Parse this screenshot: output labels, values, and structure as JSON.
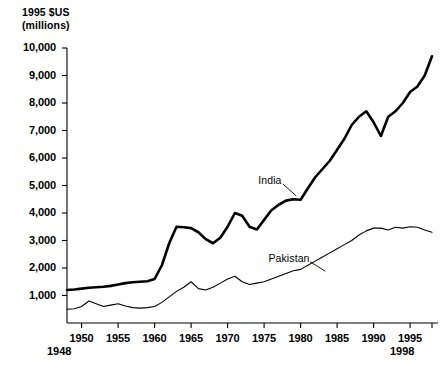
{
  "chart_data": {
    "type": "line",
    "title": "",
    "ylabel": "1995 $US (millions)",
    "ylabel_line1": "1995 $US",
    "ylabel_line2": "(millions)",
    "xlabel": "",
    "xlim": [
      1948,
      1998
    ],
    "ylim": [
      0,
      10000
    ],
    "grid": false,
    "legend": "inline-annotations",
    "ytick_labels": [
      "10,000",
      "9,000",
      "8,000",
      "7,000",
      "6,000",
      "5,000",
      "4,000",
      "3,000",
      "2,000",
      "1,000"
    ],
    "ytick_values": [
      10000,
      9000,
      8000,
      7000,
      6000,
      5000,
      4000,
      3000,
      2000,
      1000
    ],
    "xtick_labels": [
      "1950",
      "1955",
      "1960",
      "1965",
      "1970",
      "1975",
      "1980",
      "1985",
      "1990",
      "1995"
    ],
    "xtick_values": [
      1950,
      1955,
      1960,
      1965,
      1970,
      1975,
      1980,
      1985,
      1990,
      1995
    ],
    "x_start_label": "1948",
    "x_end_label": "1998",
    "series": [
      {
        "name": "India",
        "label": "India",
        "style": "thick",
        "x": [
          1948,
          1949,
          1950,
          1951,
          1952,
          1953,
          1954,
          1955,
          1956,
          1957,
          1958,
          1959,
          1960,
          1961,
          1962,
          1963,
          1964,
          1965,
          1966,
          1967,
          1968,
          1969,
          1970,
          1971,
          1972,
          1973,
          1974,
          1975,
          1976,
          1977,
          1978,
          1979,
          1980,
          1981,
          1982,
          1983,
          1984,
          1985,
          1986,
          1987,
          1988,
          1989,
          1990,
          1991,
          1992,
          1993,
          1994,
          1995,
          1996,
          1997,
          1998
        ],
        "values": [
          1200,
          1220,
          1250,
          1280,
          1300,
          1320,
          1350,
          1400,
          1450,
          1480,
          1500,
          1520,
          1600,
          2100,
          2900,
          3500,
          3480,
          3450,
          3300,
          3050,
          2900,
          3100,
          3500,
          4000,
          3900,
          3500,
          3400,
          3750,
          4100,
          4300,
          4450,
          4500,
          4480,
          4900,
          5300,
          5600,
          5900,
          6300,
          6700,
          7200,
          7500,
          7700,
          7300,
          6800,
          7500,
          7700,
          8000,
          8400,
          8600,
          9000,
          9700
        ]
      },
      {
        "name": "Pakistan",
        "label": "Pakistan",
        "style": "thin",
        "x": [
          1948,
          1949,
          1950,
          1951,
          1952,
          1953,
          1954,
          1955,
          1956,
          1957,
          1958,
          1959,
          1960,
          1961,
          1962,
          1963,
          1964,
          1965,
          1966,
          1967,
          1968,
          1969,
          1970,
          1971,
          1972,
          1973,
          1974,
          1975,
          1976,
          1977,
          1978,
          1979,
          1980,
          1981,
          1982,
          1983,
          1984,
          1985,
          1986,
          1987,
          1988,
          1989,
          1990,
          1991,
          1992,
          1993,
          1994,
          1995,
          1996,
          1997,
          1998
        ],
        "values": [
          500,
          520,
          600,
          800,
          700,
          600,
          650,
          700,
          620,
          560,
          540,
          560,
          600,
          750,
          950,
          1150,
          1300,
          1500,
          1250,
          1200,
          1300,
          1450,
          1600,
          1700,
          1500,
          1400,
          1450,
          1500,
          1600,
          1700,
          1800,
          1900,
          1950,
          2100,
          2250,
          2400,
          2550,
          2700,
          2850,
          3000,
          3200,
          3350,
          3450,
          3450,
          3380,
          3480,
          3450,
          3500,
          3480,
          3380,
          3300
        ]
      }
    ]
  },
  "annotations": {
    "india": {
      "label": "India"
    },
    "pakistan": {
      "label": "Pakistan"
    }
  }
}
